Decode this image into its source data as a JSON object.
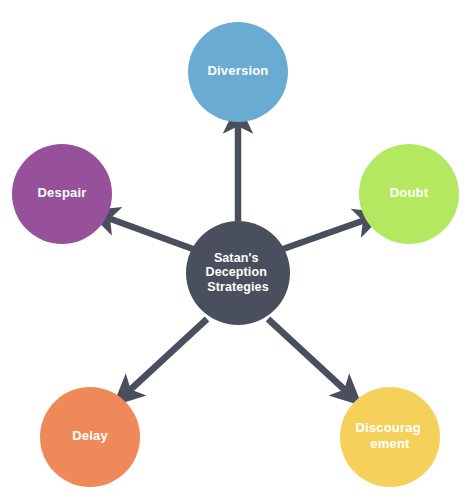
{
  "diagram": {
    "type": "radial-hub-and-spoke",
    "background_color": "#ffffff",
    "arrow_color": "#4a4f5e",
    "label_color": "#ffffff",
    "center": {
      "name": "center-node",
      "label_lines": [
        "Satan's",
        "Deception",
        "Strategies"
      ],
      "line1": "Satan's",
      "line2": "Deception",
      "line3": "Strategies",
      "color": "#4a4f5e",
      "cx": 238,
      "cy": 273,
      "r": 52
    },
    "nodes": [
      {
        "id": "diversion",
        "label": "Diversion",
        "label_lines": [
          "Diversion"
        ],
        "color": "#6aabd2",
        "cx": 238,
        "cy": 72,
        "r": 50,
        "text_dy": 0,
        "arrow": {
          "x1": 238,
          "y1": 221,
          "x2": 238,
          "y2": 124
        }
      },
      {
        "id": "doubt",
        "label": "Doubt",
        "label_lines": [
          "Doubt"
        ],
        "color": "#b5e861",
        "cx": 409,
        "cy": 194,
        "r": 50,
        "text_dy": 0,
        "arrow": {
          "x1": 283,
          "y1": 249,
          "x2": 365,
          "y2": 220
        }
      },
      {
        "id": "despair",
        "label": "Despair",
        "label_lines": [
          "Despair"
        ],
        "color": "#96519a",
        "cx": 62,
        "cy": 194,
        "r": 50,
        "text_dy": 0,
        "arrow": {
          "x1": 193,
          "y1": 249,
          "x2": 108,
          "y2": 218
        }
      },
      {
        "id": "delay",
        "label": "Delay",
        "label_lines": [
          "Delay"
        ],
        "color": "#f0895a",
        "cx": 90,
        "cy": 437,
        "r": 50,
        "text_dy": 0,
        "arrow": {
          "x1": 207,
          "y1": 319,
          "x2": 129,
          "y2": 391
        }
      },
      {
        "id": "discouragement",
        "label": "Discouragement",
        "label_lines": [
          "Discourag",
          "ement"
        ],
        "line1": "Discourag",
        "line2": "ement",
        "color": "#f5d05a",
        "cx": 390,
        "cy": 437,
        "r": 50,
        "text_dy": 0,
        "arrow": {
          "x1": 268,
          "y1": 319,
          "x2": 346,
          "y2": 391
        }
      }
    ]
  }
}
